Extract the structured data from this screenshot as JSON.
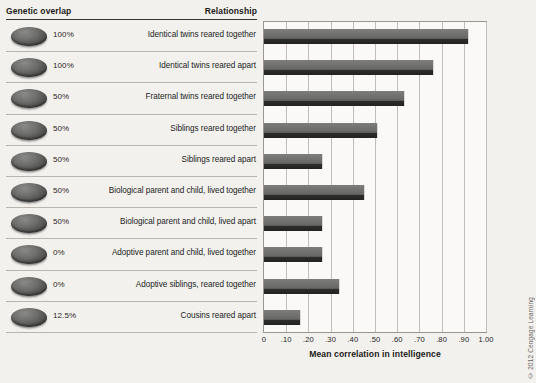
{
  "header": {
    "genetic_overlap_label": "Genetic overlap",
    "relationship_label": "Relationship"
  },
  "credit": "© 2012 Cengage Learning",
  "chart_data": {
    "type": "bar",
    "orientation": "horizontal",
    "title": "",
    "xlabel": "Mean correlation in intelligence",
    "ylabel": "",
    "xlim": [
      0,
      1.0
    ],
    "grid": true,
    "legend": false,
    "xticklabels": [
      "0",
      ".10",
      ".20",
      ".30",
      ".40",
      ".50",
      ".60",
      ".70",
      ".80",
      ".90",
      "1.00"
    ],
    "xtickvalues": [
      0,
      0.1,
      0.2,
      0.3,
      0.4,
      0.5,
      0.6,
      0.7,
      0.8,
      0.9,
      1.0
    ],
    "categories": [
      "Identical twins reared together",
      "Identical twins reared apart",
      "Fraternal twins reared together",
      "Siblings reared together",
      "Siblings reared apart",
      "Biological parent and child, lived together",
      "Biological parent and child, lived apart",
      "Adoptive parent and child, lived together",
      "Adoptive siblings, reared together",
      "Cousins reared apart"
    ],
    "values": [
      0.92,
      0.76,
      0.63,
      0.51,
      0.26,
      0.45,
      0.26,
      0.26,
      0.34,
      0.16
    ],
    "genetic_overlap": [
      "100%",
      "100%",
      "50%",
      "50%",
      "50%",
      "50%",
      "50%",
      "0%",
      "0%",
      "12.5%"
    ],
    "bar_color": "#6d6d6b",
    "bar_shadow_color": "#232321",
    "plot_background": "#faf9f7",
    "grid_color": "#c2bdb8"
  }
}
